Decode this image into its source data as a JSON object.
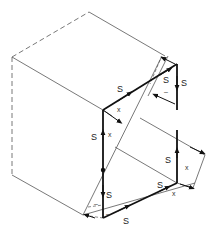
{
  "figure": {
    "type": "isometric shear-flow diagram of a channel / lipped section",
    "labels": {
      "s_top_flange": "S",
      "s_top_lip_a": "S",
      "s_top_lip_b": "S",
      "s_web_upper": "S",
      "s_web_lower": "S",
      "s_bottom_flange_a": "S",
      "s_bottom_flange_b": "S",
      "s_right_lip": "S",
      "x_top_flange": "x",
      "x_web_upper": "x",
      "x_bottom_lip": "x",
      "x_right_lip": "x",
      "dash_top_lip": "–",
      "dash_bottom_a": "–",
      "dash_bottom_b": "–"
    },
    "colors": {
      "thin_line": "#555555",
      "thick_line": "#111111",
      "arrow": "#111111",
      "background": "#ffffff"
    }
  }
}
